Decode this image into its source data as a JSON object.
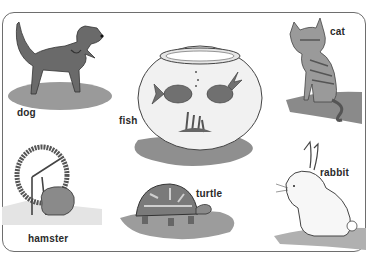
{
  "scene": {
    "description": "Illustrated worksheet of common pets with labels",
    "frame_color": "#6e6e6e",
    "shadow_color": "#8a8a8a",
    "animal_color": "#6a6a6a"
  },
  "animals": [
    {
      "id": "dog",
      "label": "dog"
    },
    {
      "id": "fish",
      "label": "fish"
    },
    {
      "id": "cat",
      "label": "cat"
    },
    {
      "id": "hamster",
      "label": "hamster"
    },
    {
      "id": "turtle",
      "label": "turtle"
    },
    {
      "id": "rabbit",
      "label": "rabbit"
    }
  ]
}
